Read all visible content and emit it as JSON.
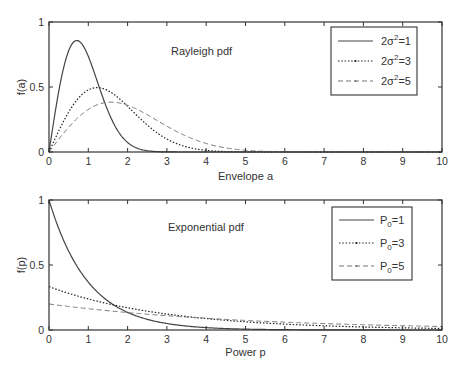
{
  "chart_data": [
    {
      "type": "line",
      "title": "Rayleigh pdf",
      "xlabel": "Envelope a",
      "ylabel": "f(a)",
      "xlim": [
        0,
        10
      ],
      "ylim": [
        0,
        1
      ],
      "xticks": [
        "0",
        "1",
        "2",
        "3",
        "4",
        "5",
        "6",
        "7",
        "8",
        "9",
        "10"
      ],
      "yticks": [
        "0",
        "0.5",
        "1"
      ],
      "grid": false,
      "legend_position": "upper right",
      "formula": "f(a) = (2a / (2σ²)) · exp(-a² / (2σ²))",
      "x": [
        0,
        0.5,
        0.707,
        1,
        1.225,
        1.5,
        1.581,
        2,
        2.5,
        3,
        4,
        5,
        6,
        7,
        8,
        9,
        10
      ],
      "series": [
        {
          "name": "2σ²=1",
          "param": 1,
          "style": "solid",
          "values": [
            0,
            0.779,
            0.858,
            0.736,
            0.545,
            0.316,
            0.259,
            0.073,
            0.01,
            0.0007,
            0,
            0,
            0,
            0,
            0,
            0,
            0
          ]
        },
        {
          "name": "2σ²=3",
          "param": 3,
          "style": "dotted",
          "values": [
            0,
            0.307,
            0.4,
            0.478,
            0.495,
            0.474,
            0.46,
            0.351,
            0.207,
            0.1,
            0.013,
            0.0008,
            0,
            0,
            0,
            0,
            0
          ]
        },
        {
          "name": "2σ²=5",
          "param": 5,
          "style": "dashed",
          "values": [
            0,
            0.19,
            0.256,
            0.327,
            0.362,
            0.383,
            0.384,
            0.359,
            0.287,
            0.199,
            0.065,
            0.013,
            0.0016,
            0.0001,
            0,
            0,
            0
          ]
        }
      ]
    },
    {
      "type": "line",
      "title": "Exponential pdf",
      "xlabel": "Power p",
      "ylabel": "f(p)",
      "xlim": [
        0,
        10
      ],
      "ylim": [
        0,
        1
      ],
      "xticks": [
        "0",
        "1",
        "2",
        "3",
        "4",
        "5",
        "6",
        "7",
        "8",
        "9",
        "10"
      ],
      "yticks": [
        "0",
        "0.5",
        "1"
      ],
      "grid": false,
      "legend_position": "upper right",
      "formula": "f(p) = (1/P0) · exp(-p / P0)",
      "x": [
        0,
        0.5,
        1,
        1.5,
        2,
        3,
        4,
        5,
        6,
        7,
        8,
        9,
        10
      ],
      "series": [
        {
          "name": "P0=1",
          "param": 1,
          "style": "solid",
          "values": [
            1.0,
            0.607,
            0.368,
            0.223,
            0.135,
            0.05,
            0.018,
            0.007,
            0.002,
            0.001,
            0.0003,
            0.0001,
            5e-05
          ]
        },
        {
          "name": "P0=3",
          "param": 3,
          "style": "dotted",
          "values": [
            0.333,
            0.282,
            0.239,
            0.202,
            0.171,
            0.123,
            0.088,
            0.063,
            0.045,
            0.032,
            0.023,
            0.017,
            0.012
          ]
        },
        {
          "name": "P0=5",
          "param": 5,
          "style": "dashed",
          "values": [
            0.2,
            0.181,
            0.164,
            0.148,
            0.134,
            0.11,
            0.09,
            0.074,
            0.061,
            0.049,
            0.04,
            0.033,
            0.027
          ]
        }
      ]
    }
  ],
  "plots": {
    "top": {
      "title": "Rayleigh pdf",
      "xlabel": "Envelope a",
      "ylabel": "f(a)",
      "yticks": {
        "y0": "0",
        "y05": "0.5",
        "y1": "1"
      },
      "xticks": [
        "0",
        "1",
        "2",
        "3",
        "4",
        "5",
        "6",
        "7",
        "8",
        "9",
        "10"
      ],
      "legend": [
        {
          "pre": "2σ",
          "sup": "2",
          "post": "=1"
        },
        {
          "pre": "2σ",
          "sup": "2",
          "post": "=3"
        },
        {
          "pre": "2σ",
          "sup": "2",
          "post": "=5"
        }
      ]
    },
    "bottom": {
      "title": "Exponential pdf",
      "xlabel": "Power p",
      "ylabel": "f(p)",
      "yticks": {
        "y0": "0",
        "y05": "0.5",
        "y1": "1"
      },
      "xticks": [
        "0",
        "1",
        "2",
        "3",
        "4",
        "5",
        "6",
        "7",
        "8",
        "9",
        "10"
      ],
      "legend": [
        {
          "pre": "P",
          "sub": "0",
          "post": "=1"
        },
        {
          "pre": "P",
          "sub": "0",
          "post": "=3"
        },
        {
          "pre": "P",
          "sub": "0",
          "post": "=5"
        }
      ]
    }
  },
  "colors": {
    "axis": "#333333",
    "curve_solid": "#444444",
    "curve_dotted": "#222222",
    "curve_dashed": "#777777"
  }
}
